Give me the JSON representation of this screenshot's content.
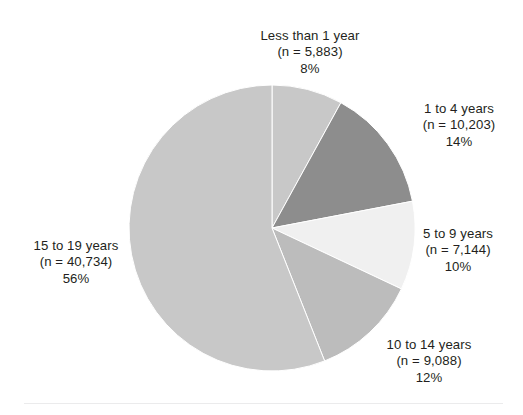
{
  "chart_data": {
    "type": "pie",
    "title": "",
    "subtitle": "",
    "xlabel": "",
    "ylabel": "",
    "legend_position": "callout-labels",
    "grid": false,
    "total_n": 73052,
    "categories": [
      "Less than 1 year",
      "1 to 4 years",
      "5 to 9 years",
      "10 to 14 years",
      "15 to 19 years"
    ],
    "values": [
      8,
      14,
      10,
      12,
      56
    ],
    "counts": [
      5883,
      10203,
      7144,
      9088,
      40734
    ],
    "slices": [
      {
        "label": "Less than 1 year",
        "n_text": "(n = 5,883)",
        "pct_text": "8%",
        "value": 8,
        "count": 5883,
        "color": "#c8c8c8",
        "start_angle": 0,
        "end_angle": 28.8
      },
      {
        "label": "1 to 4 years",
        "n_text": "(n = 10,203)",
        "pct_text": "14%",
        "value": 14,
        "count": 10203,
        "color": "#8d8d8d",
        "start_angle": 28.8,
        "end_angle": 79.2
      },
      {
        "label": "5 to 9 years",
        "n_text": "(n = 7,144)",
        "pct_text": "10%",
        "value": 10,
        "count": 7144,
        "color": "#f0f0f0",
        "start_angle": 79.2,
        "end_angle": 115.2
      },
      {
        "label": "10 to 14 years",
        "n_text": "(n = 9,088)",
        "pct_text": "12%",
        "value": 12,
        "count": 9088,
        "color": "#bcbcbc",
        "start_angle": 115.2,
        "end_angle": 158.4
      },
      {
        "label": "15 to 19 years",
        "n_text": "(n = 40,734)",
        "pct_text": "56%",
        "value": 56,
        "count": 40734,
        "color": "#c8c8c8",
        "start_angle": 158.4,
        "end_angle": 360
      }
    ]
  },
  "figure": {
    "background_color": "#ffffff",
    "text_color": "#231f20",
    "rule_color": "#ebebec",
    "center_x": 272,
    "center_y": 228,
    "radius": 143
  }
}
